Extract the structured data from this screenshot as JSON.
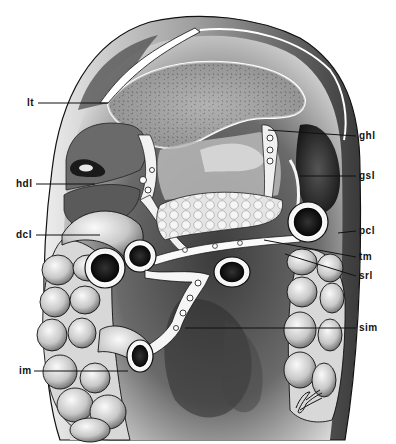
{
  "figure": {
    "type": "anatomical-illustration",
    "colors": {
      "ink": "#111111",
      "paper": "#ffffff",
      "shade_dark": "#2a2a2a",
      "shade_mid": "#7a7a7a",
      "shade_light": "#c9c9c9"
    },
    "labels_left": [
      {
        "id": "lt",
        "text": "lt",
        "x": 28,
        "y": 103,
        "line_to": [
          108,
          103
        ]
      },
      {
        "id": "hdl",
        "text": "hdl",
        "x": 17,
        "y": 184,
        "line_to": [
          95,
          184
        ]
      },
      {
        "id": "dcl",
        "text": "dcl",
        "x": 17,
        "y": 235,
        "line_to": [
          100,
          235
        ]
      },
      {
        "id": "im",
        "text": "im",
        "x": 20,
        "y": 371,
        "line_to": [
          128,
          371
        ]
      }
    ],
    "labels_right": [
      {
        "id": "ghl",
        "text": "ghl",
        "x": 360,
        "y": 136,
        "line_from": [
          268,
          130
        ]
      },
      {
        "id": "gsl",
        "text": "gsl",
        "x": 360,
        "y": 176,
        "line_from": [
          300,
          176
        ]
      },
      {
        "id": "pcl",
        "text": "pcl",
        "x": 360,
        "y": 231,
        "line_from": [
          338,
          233
        ]
      },
      {
        "id": "tm",
        "text": "tm",
        "x": 360,
        "y": 257,
        "line_from": [
          264,
          240
        ]
      },
      {
        "id": "srl",
        "text": "srl",
        "x": 360,
        "y": 276,
        "line_from": [
          285,
          254
        ]
      },
      {
        "id": "sim",
        "text": "sim",
        "x": 360,
        "y": 328,
        "line_from": [
          185,
          328
        ]
      }
    ],
    "signature": "artist signature (cursive, illegible)"
  }
}
